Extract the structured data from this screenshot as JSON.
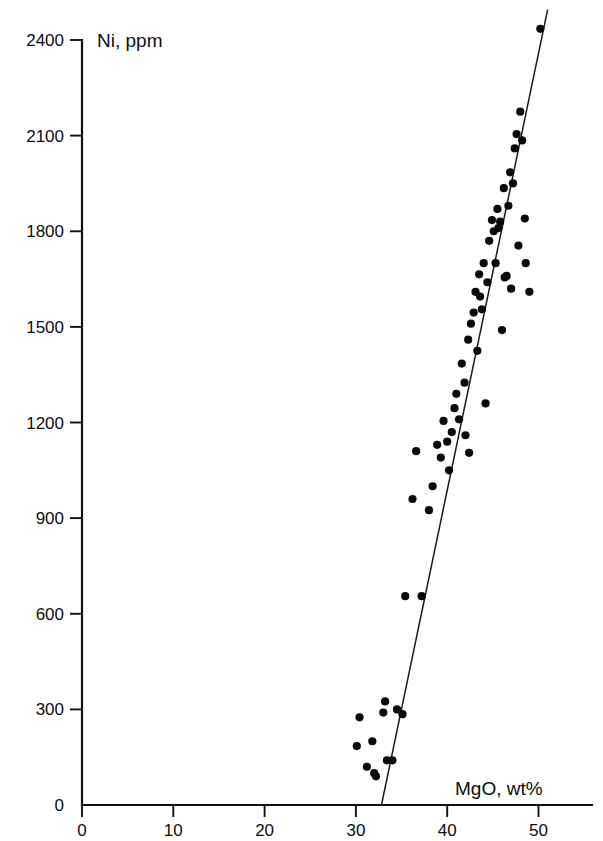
{
  "chart_data": {
    "type": "scatter",
    "title": "",
    "subtitle": "",
    "xlabel": "MgO, wt%",
    "ylabel": "Ni, ppm",
    "xlim": [
      0,
      52.5
    ],
    "ylim": [
      0,
      2500
    ],
    "xticks": [
      0,
      10,
      20,
      30,
      40,
      50
    ],
    "xtick_labels": [
      "0",
      "10",
      "20",
      "30",
      "40",
      "50"
    ],
    "yticks": [
      0,
      300,
      600,
      900,
      1200,
      1500,
      1800,
      2100,
      2400
    ],
    "ytick_labels": [
      "0",
      "300",
      "600",
      "900",
      "1200",
      "1500",
      "1800",
      "2100",
      "2400"
    ],
    "grid": false,
    "legend": null,
    "marker": "filled-circle",
    "marker_color": "#0a0a0a",
    "marker_size_px": 4.6,
    "series": [
      {
        "name": "samples",
        "points": [
          [
            30.1,
            185
          ],
          [
            30.4,
            275
          ],
          [
            31.2,
            120
          ],
          [
            31.8,
            200
          ],
          [
            32.0,
            100
          ],
          [
            32.2,
            90
          ],
          [
            33.0,
            290
          ],
          [
            33.2,
            325
          ],
          [
            33.4,
            140
          ],
          [
            34.0,
            140
          ],
          [
            34.5,
            300
          ],
          [
            35.1,
            285
          ],
          [
            35.4,
            655
          ],
          [
            36.2,
            960
          ],
          [
            36.6,
            1110
          ],
          [
            37.2,
            655
          ],
          [
            38.0,
            925
          ],
          [
            38.4,
            1000
          ],
          [
            38.9,
            1130
          ],
          [
            39.3,
            1090
          ],
          [
            39.6,
            1205
          ],
          [
            40.0,
            1140
          ],
          [
            40.2,
            1050
          ],
          [
            40.5,
            1170
          ],
          [
            40.8,
            1245
          ],
          [
            41.0,
            1290
          ],
          [
            41.3,
            1210
          ],
          [
            41.6,
            1385
          ],
          [
            41.9,
            1325
          ],
          [
            42.0,
            1160
          ],
          [
            42.3,
            1460
          ],
          [
            42.4,
            1105
          ],
          [
            42.6,
            1510
          ],
          [
            42.9,
            1545
          ],
          [
            43.1,
            1610
          ],
          [
            43.3,
            1425
          ],
          [
            43.5,
            1665
          ],
          [
            43.6,
            1595
          ],
          [
            43.8,
            1555
          ],
          [
            44.0,
            1700
          ],
          [
            44.2,
            1260
          ],
          [
            44.4,
            1640
          ],
          [
            44.6,
            1770
          ],
          [
            44.9,
            1835
          ],
          [
            45.1,
            1800
          ],
          [
            45.3,
            1700
          ],
          [
            45.5,
            1870
          ],
          [
            45.6,
            1810
          ],
          [
            45.8,
            1830
          ],
          [
            46.0,
            1490
          ],
          [
            46.2,
            1935
          ],
          [
            46.3,
            1655
          ],
          [
            46.5,
            1660
          ],
          [
            46.7,
            1880
          ],
          [
            46.9,
            1985
          ],
          [
            47.0,
            1620
          ],
          [
            47.2,
            1950
          ],
          [
            47.4,
            2060
          ],
          [
            47.6,
            2105
          ],
          [
            47.8,
            1755
          ],
          [
            48.0,
            2175
          ],
          [
            48.2,
            2085
          ],
          [
            48.5,
            1840
          ],
          [
            48.6,
            1700
          ],
          [
            49.0,
            1610
          ],
          [
            50.2,
            2435
          ]
        ]
      }
    ],
    "fit_line": {
      "name": "regression-line",
      "x_start": 32.8,
      "y_start": 0,
      "x_end": 51.0,
      "y_end": 2495,
      "color": "#1a1a1a"
    }
  },
  "axes": {
    "x_axis_name": "MgO, wt%",
    "y_axis_name": "Ni, ppm"
  }
}
